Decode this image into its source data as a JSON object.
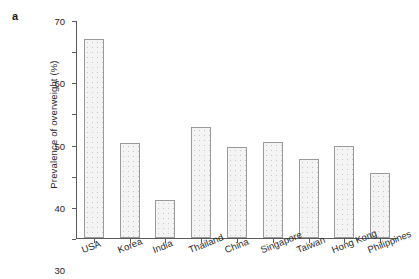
{
  "panel": {
    "label": "a"
  },
  "chart_data": {
    "type": "bar",
    "title": "",
    "xlabel": "",
    "ylabel": "Prevalence of overweight (%)",
    "categories": [
      "USA",
      "Korea",
      "India",
      "Thailand",
      "China",
      "Singapore",
      "Taiwan",
      "Hong Kong",
      "Philippines"
    ],
    "values": [
      63.8,
      30.6,
      12.3,
      35.5,
      29.3,
      30.7,
      25.5,
      29.4,
      20.8
    ],
    "ylim": [
      0,
      70
    ],
    "yticks": [
      0,
      10,
      20,
      30,
      40,
      50,
      60,
      70
    ],
    "ytick_labels": [
      "0",
      "10",
      "20",
      "30",
      "40",
      "50",
      "60",
      "70"
    ],
    "grid": false,
    "legend": false,
    "legend_position": "none",
    "bar_fill": "#f4f4f4",
    "bar_edge": "#9a9a9a",
    "axis_color": "#5a5a5a",
    "text_color": "#262626"
  }
}
